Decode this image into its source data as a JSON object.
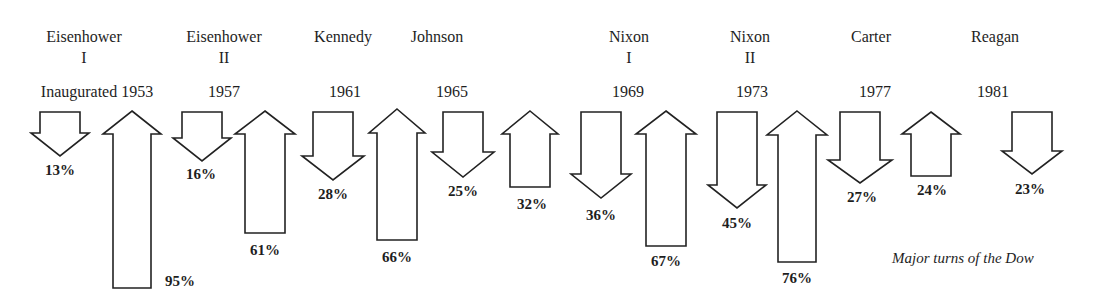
{
  "chart_data": {
    "type": "bar",
    "title": "",
    "caption": "Major turns of the Dow",
    "xlabel": "",
    "ylabel": "",
    "grid": false,
    "legend": null,
    "presidents": [
      {
        "name": "Eisenhower",
        "term": "I",
        "year_label": "Inaugurated 1953",
        "year": 1953
      },
      {
        "name": "Eisenhower",
        "term": "II",
        "year_label": "1957",
        "year": 1957
      },
      {
        "name": "Kennedy",
        "term": "",
        "year_label": "1961",
        "year": 1961
      },
      {
        "name": "Johnson",
        "term": "",
        "year_label": "1965",
        "year": 1965
      },
      {
        "name": "Nixon",
        "term": "I",
        "year_label": "1969",
        "year": 1969
      },
      {
        "name": "Nixon",
        "term": "II",
        "year_label": "1973",
        "year": 1973
      },
      {
        "name": "Carter",
        "term": "",
        "year_label": "1977",
        "year": 1977
      },
      {
        "name": "Reagan",
        "term": "",
        "year_label": "1981",
        "year": 1981
      }
    ],
    "moves": [
      {
        "president_index": 0,
        "direction": "down",
        "value": 13,
        "label": "13%"
      },
      {
        "president_index": 0,
        "direction": "up",
        "value": 95,
        "label": "95%"
      },
      {
        "president_index": 1,
        "direction": "down",
        "value": 16,
        "label": "16%"
      },
      {
        "president_index": 1,
        "direction": "up",
        "value": 61,
        "label": "61%"
      },
      {
        "president_index": 2,
        "direction": "down",
        "value": 28,
        "label": "28%"
      },
      {
        "president_index": 2,
        "direction": "up",
        "value": 66,
        "label": "66%"
      },
      {
        "president_index": 3,
        "direction": "down",
        "value": 25,
        "label": "25%"
      },
      {
        "president_index": 3,
        "direction": "up",
        "value": 32,
        "label": "32%"
      },
      {
        "president_index": 4,
        "direction": "down",
        "value": 36,
        "label": "36%"
      },
      {
        "president_index": 4,
        "direction": "up",
        "value": 67,
        "label": "67%"
      },
      {
        "president_index": 5,
        "direction": "down",
        "value": 45,
        "label": "45%"
      },
      {
        "president_index": 5,
        "direction": "up",
        "value": 76,
        "label": "76%"
      },
      {
        "president_index": 6,
        "direction": "down",
        "value": 27,
        "label": "27%"
      },
      {
        "president_index": 6,
        "direction": "up",
        "value": 24,
        "label": "24%"
      },
      {
        "president_index": 7,
        "direction": "down",
        "value": 23,
        "label": "23%"
      }
    ],
    "categories": [
      "Eisenhower I",
      "Eisenhower II",
      "Kennedy",
      "Johnson",
      "Nixon I",
      "Nixon II",
      "Carter",
      "Reagan"
    ],
    "series": [
      {
        "name": "Decline (%)",
        "values": [
          13,
          16,
          28,
          25,
          36,
          45,
          27,
          23
        ]
      },
      {
        "name": "Rise (%)",
        "values": [
          95,
          61,
          66,
          32,
          67,
          76,
          24,
          null
        ]
      }
    ]
  },
  "headers": [
    {
      "name": "Eisenhower",
      "term": "I",
      "year": "Inaugurated 1953",
      "x_name": 84,
      "x_year": 97
    },
    {
      "name": "Eisenhower",
      "term": "II",
      "year": "1957",
      "x_name": 224,
      "x_year": 224
    },
    {
      "name": "Kennedy",
      "term": "",
      "year": "1961",
      "x_name": 343,
      "x_year": 345
    },
    {
      "name": "Johnson",
      "term": "",
      "year": "1965",
      "x_name": 437,
      "x_year": 452
    },
    {
      "name": "Nixon",
      "term": "I",
      "year": "1969",
      "x_name": 629,
      "x_year": 628
    },
    {
      "name": "Nixon",
      "term": "II",
      "year": "1973",
      "x_name": 750,
      "x_year": 752
    },
    {
      "name": "Carter",
      "term": "",
      "year": "1977",
      "x_name": 871,
      "x_year": 875
    },
    {
      "name": "Reagan",
      "term": "",
      "year": "1981",
      "x_name": 995,
      "x_year": 993
    }
  ],
  "arrows": [
    {
      "dir": "down",
      "cx": 60,
      "half": 20,
      "wing": 29,
      "top": 112,
      "neck": 133,
      "end": 156,
      "label": "13%",
      "lx": 60,
      "ly": 163
    },
    {
      "dir": "up",
      "cx": 132,
      "half": 19,
      "wing": 29,
      "top": 111,
      "neck": 134,
      "end": 288,
      "label": "95%",
      "lx": 180,
      "ly": 274
    },
    {
      "dir": "down",
      "cx": 202,
      "half": 20,
      "wing": 29,
      "top": 112,
      "neck": 138,
      "end": 161,
      "label": "16%",
      "lx": 201,
      "ly": 167
    },
    {
      "dir": "up",
      "cx": 265,
      "half": 20,
      "wing": 30,
      "top": 111,
      "neck": 134,
      "end": 233,
      "label": "61%",
      "lx": 265,
      "ly": 243
    },
    {
      "dir": "down",
      "cx": 333,
      "half": 20,
      "wing": 31,
      "top": 112,
      "neck": 156,
      "end": 180,
      "label": "28%",
      "lx": 333,
      "ly": 187
    },
    {
      "dir": "up",
      "cx": 397,
      "half": 20,
      "wing": 28,
      "top": 109,
      "neck": 133,
      "end": 240,
      "label": "66%",
      "lx": 397,
      "ly": 250
    },
    {
      "dir": "down",
      "cx": 463,
      "half": 20,
      "wing": 31,
      "top": 112,
      "neck": 152,
      "end": 177,
      "label": "25%",
      "lx": 463,
      "ly": 184
    },
    {
      "dir": "up",
      "cx": 530,
      "half": 20,
      "wing": 28,
      "top": 111,
      "neck": 134,
      "end": 187,
      "label": "32%",
      "lx": 532,
      "ly": 197
    },
    {
      "dir": "down",
      "cx": 601,
      "half": 20,
      "wing": 30,
      "top": 112,
      "neck": 174,
      "end": 198,
      "label": "36%",
      "lx": 601,
      "ly": 208
    },
    {
      "dir": "up",
      "cx": 666,
      "half": 20,
      "wing": 30,
      "top": 111,
      "neck": 134,
      "end": 246,
      "label": "67%",
      "lx": 666,
      "ly": 254
    },
    {
      "dir": "down",
      "cx": 737,
      "half": 20,
      "wing": 29,
      "top": 112,
      "neck": 185,
      "end": 208,
      "label": "45%",
      "lx": 737,
      "ly": 216
    },
    {
      "dir": "up",
      "cx": 797,
      "half": 19,
      "wing": 30,
      "top": 111,
      "neck": 135,
      "end": 262,
      "label": "76%",
      "lx": 797,
      "ly": 271
    },
    {
      "dir": "down",
      "cx": 860,
      "half": 20,
      "wing": 32,
      "top": 112,
      "neck": 160,
      "end": 183,
      "label": "27%",
      "lx": 862,
      "ly": 190
    },
    {
      "dir": "up",
      "cx": 931,
      "half": 20,
      "wing": 29,
      "top": 112,
      "neck": 134,
      "end": 176,
      "label": "24%",
      "lx": 932,
      "ly": 183
    },
    {
      "dir": "down",
      "cx": 1032,
      "half": 20,
      "wing": 30,
      "top": 112,
      "neck": 151,
      "end": 174,
      "label": "23%",
      "lx": 1030,
      "ly": 182
    }
  ],
  "caption": {
    "text": "Major turns of the Dow",
    "x": 892,
    "y": 251
  }
}
